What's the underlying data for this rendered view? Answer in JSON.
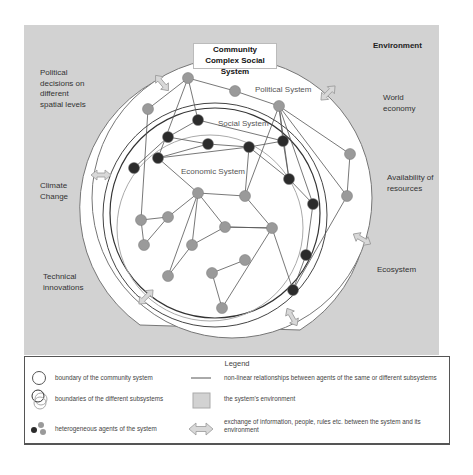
{
  "title": {
    "line1": "Community",
    "line2": "Complex Social System"
  },
  "environment": {
    "title": "Environment",
    "factors": [
      {
        "id": "political",
        "lines": [
          "Political",
          "decisions on",
          "different",
          "spatial levels"
        ]
      },
      {
        "id": "world",
        "lines": [
          "World",
          "economy"
        ]
      },
      {
        "id": "climate",
        "lines": [
          "Climate",
          "Change"
        ]
      },
      {
        "id": "resources",
        "lines": [
          "Availability of",
          "resources"
        ]
      },
      {
        "id": "technical",
        "lines": [
          "Technical",
          "innovations"
        ]
      },
      {
        "id": "ecosystem",
        "lines": [
          "Ecosystem"
        ]
      }
    ]
  },
  "subsystems": {
    "political": "Political System",
    "social": "Social System",
    "economic": "Economic System"
  },
  "colors": {
    "environment": "#d2d2d2",
    "agent_light": "#9a9a9a",
    "agent_dark": "#2b2b2b",
    "edge": "#555555",
    "arrow_fill": "#d8d8d8",
    "arrow_stroke": "#999999"
  },
  "network": {
    "nodes": [
      {
        "id": "p1",
        "x": 188,
        "y": 78,
        "t": "l"
      },
      {
        "id": "p2",
        "x": 235,
        "y": 91,
        "t": "l"
      },
      {
        "id": "p3",
        "x": 148,
        "y": 109,
        "t": "l"
      },
      {
        "id": "p4",
        "x": 279,
        "y": 106,
        "t": "l"
      },
      {
        "id": "p5",
        "x": 350,
        "y": 154,
        "t": "l"
      },
      {
        "id": "p6",
        "x": 347,
        "y": 196,
        "t": "l"
      },
      {
        "id": "s1",
        "x": 198,
        "y": 120,
        "t": "d"
      },
      {
        "id": "s2",
        "x": 168,
        "y": 137,
        "t": "d"
      },
      {
        "id": "s3",
        "x": 208,
        "y": 144,
        "t": "d"
      },
      {
        "id": "s4",
        "x": 158,
        "y": 158,
        "t": "d"
      },
      {
        "id": "s5",
        "x": 249,
        "y": 147,
        "t": "d"
      },
      {
        "id": "s6",
        "x": 283,
        "y": 141,
        "t": "d"
      },
      {
        "id": "s7",
        "x": 134,
        "y": 168,
        "t": "d"
      },
      {
        "id": "s8",
        "x": 289,
        "y": 179,
        "t": "d"
      },
      {
        "id": "s9",
        "x": 313,
        "y": 204,
        "t": "d"
      },
      {
        "id": "s10",
        "x": 306,
        "y": 255,
        "t": "d"
      },
      {
        "id": "s11",
        "x": 293,
        "y": 290,
        "t": "d"
      },
      {
        "id": "e1",
        "x": 198,
        "y": 193,
        "t": "l"
      },
      {
        "id": "e2",
        "x": 245,
        "y": 196,
        "t": "l"
      },
      {
        "id": "e3",
        "x": 141,
        "y": 220,
        "t": "l"
      },
      {
        "id": "e4",
        "x": 168,
        "y": 217,
        "t": "l"
      },
      {
        "id": "e5",
        "x": 225,
        "y": 227,
        "t": "l"
      },
      {
        "id": "e6",
        "x": 144,
        "y": 245,
        "t": "l"
      },
      {
        "id": "e7",
        "x": 192,
        "y": 245,
        "t": "l"
      },
      {
        "id": "e8",
        "x": 272,
        "y": 228,
        "t": "l"
      },
      {
        "id": "e9",
        "x": 168,
        "y": 276,
        "t": "l"
      },
      {
        "id": "e10",
        "x": 212,
        "y": 273,
        "t": "l"
      },
      {
        "id": "e11",
        "x": 245,
        "y": 260,
        "t": "l"
      },
      {
        "id": "e12",
        "x": 222,
        "y": 308,
        "t": "l"
      }
    ],
    "edges": [
      [
        "p1",
        "p2"
      ],
      [
        "p2",
        "p4"
      ],
      [
        "p1",
        "p3"
      ],
      [
        "p1",
        "s1"
      ],
      [
        "p1",
        "s4"
      ],
      [
        "p3",
        "e3"
      ],
      [
        "p4",
        "p5"
      ],
      [
        "p4",
        "s6"
      ],
      [
        "p4",
        "s9"
      ],
      [
        "p4",
        "s8"
      ],
      [
        "p4",
        "e2"
      ],
      [
        "p4",
        "p6"
      ],
      [
        "p5",
        "p6"
      ],
      [
        "p6",
        "s11"
      ],
      [
        "s1",
        "s2"
      ],
      [
        "s1",
        "s6"
      ],
      [
        "s2",
        "s3"
      ],
      [
        "s2",
        "s7"
      ],
      [
        "s3",
        "s4"
      ],
      [
        "s3",
        "s5"
      ],
      [
        "s4",
        "s5"
      ],
      [
        "s4",
        "e1"
      ],
      [
        "s5",
        "s6"
      ],
      [
        "s5",
        "s8"
      ],
      [
        "s5",
        "e2"
      ],
      [
        "s6",
        "s8"
      ],
      [
        "s8",
        "s9"
      ],
      [
        "s9",
        "s10"
      ],
      [
        "s10",
        "s11"
      ],
      [
        "e1",
        "e2"
      ],
      [
        "e1",
        "e4"
      ],
      [
        "e1",
        "e7"
      ],
      [
        "e1",
        "e9"
      ],
      [
        "e1",
        "e5"
      ],
      [
        "e3",
        "e4"
      ],
      [
        "e3",
        "e6"
      ],
      [
        "e4",
        "e6"
      ],
      [
        "e5",
        "e7"
      ],
      [
        "e5",
        "e8"
      ],
      [
        "e8",
        "e12"
      ],
      [
        "e10",
        "e11"
      ],
      [
        "e10",
        "e12"
      ],
      [
        "e7",
        "e9"
      ],
      [
        "e2",
        "e8"
      ],
      [
        "e8",
        "s11"
      ],
      [
        "e5",
        "e8"
      ]
    ]
  },
  "legend": {
    "title": "Legend",
    "items": [
      {
        "icon": "circle-outline",
        "text": "boundary of the community system"
      },
      {
        "icon": "overlapping-circles",
        "text": "boundaries of the different subsystems"
      },
      {
        "icon": "agent-dots",
        "text": "heterogeneous agents of the system"
      },
      {
        "icon": "line",
        "text": "non-linear relationships between agents of the same or different subsystems"
      },
      {
        "icon": "grey-square",
        "text": "the system's environment"
      },
      {
        "icon": "double-arrow",
        "text": "exchange of information, people, rules etc. between the system and its environment"
      }
    ]
  }
}
